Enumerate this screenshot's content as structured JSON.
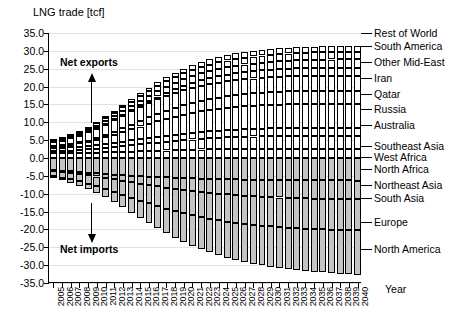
{
  "chart_data": {
    "type": "bar",
    "stacked": true,
    "title": "",
    "ylabel": "LNG trade [tcf]",
    "xlabel": "Year",
    "ylim": [
      -35,
      35
    ],
    "ytick_step": 5,
    "yticks": [
      "35.0",
      "30.0",
      "25.0",
      "20.0",
      "15.0",
      "10.0",
      "5.0",
      "0.0",
      "-5.0",
      "-10.0",
      "-15.0",
      "-20.0",
      "-25.0",
      "-30.0",
      "-35.0"
    ],
    "grid": true,
    "legend_position": "right",
    "categories": [
      "2005",
      "2006",
      "2007",
      "2008",
      "2009",
      "2010",
      "2011",
      "2012",
      "2013",
      "2014",
      "2015",
      "2016",
      "2017",
      "2018",
      "2019",
      "2020",
      "2021",
      "2022",
      "2023",
      "2024",
      "2025",
      "2026",
      "2027",
      "2028",
      "2029",
      "2030",
      "2031",
      "2032",
      "2033",
      "2034",
      "2035",
      "2036",
      "2037",
      "2038",
      "2039",
      "2040"
    ],
    "annotations": [
      {
        "text": "Net exports",
        "direction": "up"
      },
      {
        "text": "Net imports",
        "direction": "down"
      }
    ],
    "series": [
      {
        "name": "Southeast Asia",
        "sign": "positive",
        "color": "#ffffff",
        "values": [
          1.3,
          1.32,
          1.35,
          1.38,
          1.42,
          1.48,
          1.55,
          1.62,
          1.7,
          1.78,
          1.86,
          1.94,
          2.02,
          2.1,
          2.18,
          2.26,
          2.32,
          2.38,
          2.44,
          2.48,
          2.52,
          2.55,
          2.58,
          2.6,
          2.62,
          2.63,
          2.64,
          2.65,
          2.65,
          2.65,
          2.64,
          2.63,
          2.62,
          2.6,
          2.58,
          2.56
        ]
      },
      {
        "name": "West Africa",
        "sign": "positive",
        "color": "#ffffff",
        "values": [
          0.55,
          0.62,
          0.72,
          0.85,
          0.98,
          1.12,
          1.28,
          1.45,
          1.62,
          1.8,
          1.97,
          2.14,
          2.3,
          2.46,
          2.6,
          2.74,
          2.86,
          2.97,
          3.07,
          3.16,
          3.24,
          3.31,
          3.37,
          3.42,
          3.47,
          3.51,
          3.54,
          3.57,
          3.59,
          3.61,
          3.62,
          3.63,
          3.64,
          3.64,
          3.64,
          3.64
        ]
      },
      {
        "name": "North Africa",
        "sign": "positive",
        "color": "#ffffff",
        "values": [
          0.85,
          0.88,
          0.92,
          0.96,
          1.0,
          1.05,
          1.12,
          1.2,
          1.28,
          1.36,
          1.44,
          1.52,
          1.6,
          1.67,
          1.74,
          1.8,
          1.86,
          1.91,
          1.96,
          2.0,
          2.04,
          2.07,
          2.1,
          2.12,
          2.14,
          2.16,
          2.17,
          2.18,
          2.19,
          2.19,
          2.2,
          2.2,
          2.2,
          2.2,
          2.2,
          2.2
        ]
      },
      {
        "name": "Australia",
        "sign": "positive",
        "color": "#ffffff",
        "values": [
          0.6,
          0.7,
          0.82,
          0.98,
          1.18,
          1.45,
          1.8,
          2.2,
          2.65,
          3.1,
          3.55,
          3.98,
          4.38,
          4.74,
          5.06,
          5.34,
          5.58,
          5.78,
          5.95,
          6.09,
          6.21,
          6.31,
          6.39,
          6.46,
          6.52,
          6.57,
          6.61,
          6.64,
          6.67,
          6.69,
          6.71,
          6.72,
          6.73,
          6.74,
          6.75,
          6.76
        ]
      },
      {
        "name": "Russia",
        "sign": "positive",
        "color": "#ffffff",
        "values": [
          0.05,
          0.08,
          0.12,
          0.18,
          0.28,
          0.42,
          0.6,
          0.82,
          1.06,
          1.32,
          1.58,
          1.84,
          2.08,
          2.3,
          2.5,
          2.68,
          2.84,
          2.98,
          3.1,
          3.2,
          3.29,
          3.36,
          3.42,
          3.47,
          3.51,
          3.55,
          3.58,
          3.6,
          3.62,
          3.64,
          3.65,
          3.66,
          3.67,
          3.68,
          3.68,
          3.69
        ]
      },
      {
        "name": "Qatar",
        "sign": "positive",
        "color": "#ffffff",
        "values": [
          1.05,
          1.3,
          1.6,
          1.95,
          2.35,
          2.75,
          3.1,
          3.4,
          3.62,
          3.78,
          3.9,
          3.98,
          4.04,
          4.08,
          4.11,
          4.13,
          4.15,
          4.16,
          4.17,
          4.18,
          4.18,
          4.19,
          4.19,
          4.19,
          4.2,
          4.2,
          4.2,
          4.2,
          4.2,
          4.2,
          4.2,
          4.2,
          4.2,
          4.2,
          4.2,
          4.2
        ]
      },
      {
        "name": "Iran",
        "sign": "positive",
        "color": "#ffffff",
        "values": [
          0.0,
          0.0,
          0.0,
          0.0,
          0.0,
          0.02,
          0.05,
          0.1,
          0.18,
          0.3,
          0.45,
          0.62,
          0.8,
          0.98,
          1.15,
          1.3,
          1.44,
          1.56,
          1.67,
          1.76,
          1.84,
          1.91,
          1.97,
          2.02,
          2.06,
          2.1,
          2.13,
          2.16,
          2.18,
          2.2,
          2.22,
          2.23,
          2.24,
          2.25,
          2.26,
          2.27
        ]
      },
      {
        "name": "Other Mid-East",
        "sign": "positive",
        "color": "#ffffff",
        "values": [
          0.35,
          0.4,
          0.46,
          0.54,
          0.64,
          0.74,
          0.86,
          0.98,
          1.1,
          1.22,
          1.34,
          1.45,
          1.56,
          1.66,
          1.75,
          1.83,
          1.9,
          1.96,
          2.01,
          2.06,
          2.1,
          2.13,
          2.16,
          2.18,
          2.2,
          2.22,
          2.23,
          2.24,
          2.25,
          2.26,
          2.27,
          2.27,
          2.28,
          2.28,
          2.29,
          2.29
        ]
      },
      {
        "name": "South America",
        "sign": "positive",
        "color": "#ffffff",
        "values": [
          0.3,
          0.34,
          0.4,
          0.47,
          0.55,
          0.64,
          0.74,
          0.85,
          0.96,
          1.07,
          1.18,
          1.28,
          1.38,
          1.47,
          1.55,
          1.62,
          1.69,
          1.75,
          1.8,
          1.84,
          1.88,
          1.91,
          1.94,
          1.96,
          1.98,
          2.0,
          2.01,
          2.02,
          2.03,
          2.04,
          2.05,
          2.05,
          2.06,
          2.06,
          2.07,
          2.07
        ]
      },
      {
        "name": "Rest of World",
        "sign": "positive",
        "color": "#ffffff",
        "values": [
          0.2,
          0.23,
          0.27,
          0.32,
          0.38,
          0.45,
          0.53,
          0.62,
          0.71,
          0.8,
          0.89,
          0.98,
          1.06,
          1.14,
          1.21,
          1.27,
          1.33,
          1.38,
          1.42,
          1.46,
          1.5,
          1.53,
          1.55,
          1.57,
          1.59,
          1.61,
          1.62,
          1.63,
          1.64,
          1.65,
          1.66,
          1.66,
          1.67,
          1.67,
          1.68,
          1.68
        ]
      },
      {
        "name": "Northeast Asia",
        "sign": "negative",
        "color": "#c4c4c4",
        "values": [
          -3.4,
          -3.55,
          -3.72,
          -3.9,
          -4.08,
          -4.26,
          -4.44,
          -4.62,
          -4.78,
          -4.93,
          -5.07,
          -5.2,
          -5.32,
          -5.43,
          -5.53,
          -5.62,
          -5.7,
          -5.77,
          -5.84,
          -5.9,
          -5.95,
          -6.0,
          -6.04,
          -6.08,
          -6.11,
          -6.14,
          -6.17,
          -6.19,
          -6.21,
          -6.23,
          -6.25,
          -6.26,
          -6.27,
          -6.28,
          -6.29,
          -6.3
        ]
      },
      {
        "name": "South Asia",
        "sign": "negative",
        "color": "#c4c4c4",
        "values": [
          -0.3,
          -0.38,
          -0.48,
          -0.6,
          -0.75,
          -0.92,
          -1.12,
          -1.34,
          -1.58,
          -1.84,
          -2.1,
          -2.36,
          -2.62,
          -2.87,
          -3.11,
          -3.34,
          -3.55,
          -3.75,
          -3.93,
          -4.1,
          -4.25,
          -4.39,
          -4.51,
          -4.62,
          -4.72,
          -4.81,
          -4.89,
          -4.96,
          -5.02,
          -5.08,
          -5.13,
          -5.17,
          -5.21,
          -5.25,
          -5.28,
          -5.31
        ]
      },
      {
        "name": "Europe",
        "sign": "negative",
        "color": "#c4c4c4",
        "values": [
          -1.4,
          -1.58,
          -1.8,
          -2.06,
          -2.36,
          -2.7,
          -3.08,
          -3.48,
          -3.9,
          -4.32,
          -4.74,
          -5.14,
          -5.52,
          -5.88,
          -6.2,
          -6.5,
          -6.77,
          -7.01,
          -7.23,
          -7.42,
          -7.59,
          -7.74,
          -7.87,
          -7.99,
          -8.09,
          -8.18,
          -8.26,
          -8.33,
          -8.39,
          -8.45,
          -8.5,
          -8.54,
          -8.58,
          -8.61,
          -8.64,
          -8.67
        ]
      },
      {
        "name": "North America",
        "sign": "negative",
        "color": "#c4c4c4",
        "values": [
          -0.6,
          -0.75,
          -0.95,
          -1.2,
          -1.52,
          -1.92,
          -2.4,
          -2.96,
          -3.58,
          -4.24,
          -4.92,
          -5.6,
          -6.26,
          -6.88,
          -7.46,
          -8.0,
          -8.5,
          -8.96,
          -9.38,
          -9.76,
          -10.1,
          -10.4,
          -10.67,
          -10.91,
          -11.12,
          -11.31,
          -11.48,
          -11.63,
          -11.76,
          -11.88,
          -11.99,
          -12.08,
          -12.16,
          -12.23,
          -12.3,
          -12.36
        ]
      }
    ]
  }
}
